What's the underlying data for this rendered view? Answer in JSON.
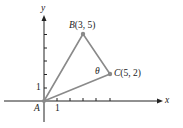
{
  "figure": {
    "x_axis_label": "x",
    "y_axis_label": "y",
    "origin_label": "A",
    "x_tick_label": "1",
    "y_tick_label": "1",
    "angle_label": "θ",
    "points": [
      {
        "name": "A",
        "label": "A",
        "x": 0,
        "y": 0
      },
      {
        "name": "B",
        "letter": "B",
        "coords": "(3, 5)",
        "x": 3,
        "y": 5
      },
      {
        "name": "C",
        "letter": "C",
        "coords": "(5, 2)",
        "x": 5,
        "y": 2
      }
    ],
    "segments": [
      [
        "A",
        "B"
      ],
      [
        "B",
        "C"
      ],
      [
        "A",
        "C"
      ]
    ],
    "colors": {
      "axis": "#222222",
      "segment": "#8a8a8a",
      "point": "#8a8a8a"
    }
  }
}
